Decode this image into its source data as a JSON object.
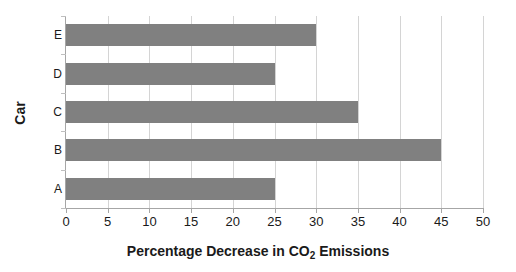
{
  "chart_data": {
    "type": "bar",
    "orientation": "horizontal",
    "title": "",
    "xlabel_parts": {
      "before": "Percentage Decrease in CO",
      "subscript": "2",
      "after": " Emissions"
    },
    "xlabel": "Percentage Decrease in CO2 Emissions",
    "ylabel": "Car",
    "categories": [
      "A",
      "B",
      "C",
      "D",
      "E"
    ],
    "values": [
      25,
      45,
      35,
      25,
      30
    ],
    "display_order_top_to_bottom": [
      "E",
      "D",
      "C",
      "B",
      "A"
    ],
    "xlim": [
      0,
      50
    ],
    "xticks": [
      0,
      5,
      10,
      15,
      20,
      25,
      30,
      35,
      40,
      45,
      50
    ],
    "xtick_labels": [
      "0",
      "5",
      "10",
      "15",
      "20",
      "25",
      "30",
      "35",
      "40",
      "45",
      "50"
    ],
    "grid": "vertical",
    "legend": "none",
    "colors": {
      "bar": "#808080",
      "gridline": "#d4d4d4",
      "axis": "#a6a6a6",
      "text": "#1a1a1a",
      "background": "#ffffff"
    }
  }
}
